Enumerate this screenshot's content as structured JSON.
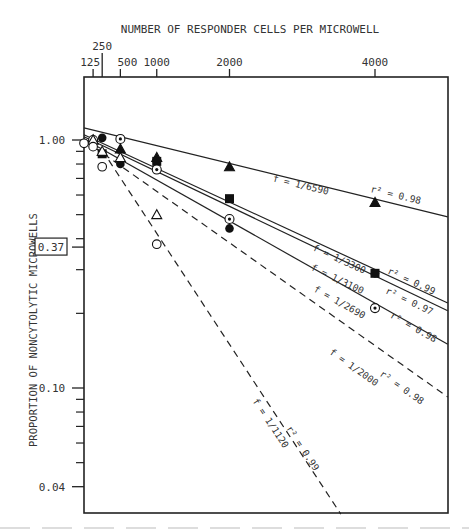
{
  "chart_data": {
    "type": "scatter",
    "title": "",
    "xlabel": "NUMBER OF RESPONDER CELLS PER MICROWELL",
    "ylabel": "PROPORTION OF NONCYTOLYTIC MICROWELLS",
    "x_axis_position": "top",
    "x_scale": "linear",
    "y_scale": "log",
    "xlim": [
      0,
      5000
    ],
    "ylim": [
      0.032,
      1.3
    ],
    "x_ticks": [
      125,
      250,
      500,
      1000,
      2000,
      4000
    ],
    "x_tick_labels": [
      "125",
      "250",
      "500",
      "1000",
      "2000",
      "4000"
    ],
    "y_tick_labels": [
      {
        "value": 1.0,
        "label": "1.00"
      },
      {
        "value": 0.37,
        "label": "0.37",
        "boxed": true
      },
      {
        "value": 0.1,
        "label": "0.10"
      },
      {
        "value": 0.04,
        "label": "0.04"
      }
    ],
    "y_minor_ticks": [
      0.9,
      0.8,
      0.7,
      0.6,
      0.5,
      0.4,
      0.3,
      0.2,
      0.09,
      0.08,
      0.07,
      0.06,
      0.05
    ],
    "grid": false,
    "series": [
      {
        "name": "filled-triangle",
        "marker": "triangle-filled",
        "fit_f": "1/6590",
        "r2": "0.98",
        "line": "solid",
        "points": [
          [
            125,
            1.0
          ],
          [
            500,
            0.92
          ],
          [
            1000,
            0.85
          ],
          [
            2000,
            0.78
          ],
          [
            4000,
            0.56
          ]
        ]
      },
      {
        "name": "filled-square",
        "marker": "square-filled",
        "fit_f": "1/3300",
        "r2": "0.99",
        "line": "solid",
        "points": [
          [
            250,
            0.88
          ],
          [
            1000,
            0.82
          ],
          [
            2000,
            0.58
          ],
          [
            4000,
            0.29
          ]
        ]
      },
      {
        "name": "filled-circle",
        "marker": "circle-filled",
        "fit_f": "1/3100",
        "r2": "0.97",
        "line": "solid",
        "points": [
          [
            250,
            1.02
          ],
          [
            500,
            0.8
          ],
          [
            1000,
            0.82
          ],
          [
            2000,
            0.44
          ],
          [
            4000,
            0.29
          ]
        ]
      },
      {
        "name": "dotted-circle",
        "marker": "circle-dotted",
        "fit_f": "1/2690",
        "r2": "0.98",
        "line": "solid",
        "points": [
          [
            125,
            1.0
          ],
          [
            500,
            1.01
          ],
          [
            1000,
            0.76
          ],
          [
            2000,
            0.48
          ],
          [
            4000,
            0.21
          ]
        ]
      },
      {
        "name": "open-triangle",
        "marker": "triangle-open",
        "fit_f": "1/2000",
        "r2": "0.98",
        "line": "dashed",
        "points": [
          [
            125,
            1.0
          ],
          [
            250,
            0.9
          ],
          [
            500,
            0.85
          ],
          [
            1000,
            0.5
          ]
        ]
      },
      {
        "name": "open-circle",
        "marker": "circle-open",
        "fit_f": "1/1120",
        "r2": "0.99",
        "line": "dashed",
        "points": [
          [
            0,
            0.97
          ],
          [
            125,
            0.94
          ],
          [
            250,
            0.78
          ],
          [
            1000,
            0.38
          ]
        ]
      }
    ],
    "fit_lines": [
      {
        "label_f": "f = 1/6590",
        "label_r2": "r² = 0.98",
        "from": [
          0,
          1.12
        ],
        "to": [
          5000,
          0.49
        ],
        "dash": false
      },
      {
        "label_f": "f = 1/3300",
        "label_r2": "r² = 0.99",
        "from": [
          0,
          1.05
        ],
        "to": [
          5000,
          0.22
        ],
        "dash": false
      },
      {
        "label_f": "f = 1/3100",
        "label_r2": "r² = 0.97",
        "from": [
          0,
          1.03
        ],
        "to": [
          5000,
          0.205
        ],
        "dash": false
      },
      {
        "label_f": "f = 1/2690",
        "label_r2": "r² = 0.98",
        "from": [
          0,
          1.01
        ],
        "to": [
          5000,
          0.15
        ],
        "dash": false
      },
      {
        "label_f": "f = 1/2000",
        "label_r2": "r² = 0.98",
        "from": [
          0,
          1.0
        ],
        "to": [
          5000,
          0.092
        ],
        "dash": true
      },
      {
        "label_f": "f = 1/1120",
        "label_r2": "r² = 0.99",
        "from": [
          250,
          0.91
        ],
        "to": [
          3530,
          0.031
        ],
        "dash": true
      }
    ],
    "annotations": [
      "0.37 reference level (boxed) on y axis"
    ]
  }
}
